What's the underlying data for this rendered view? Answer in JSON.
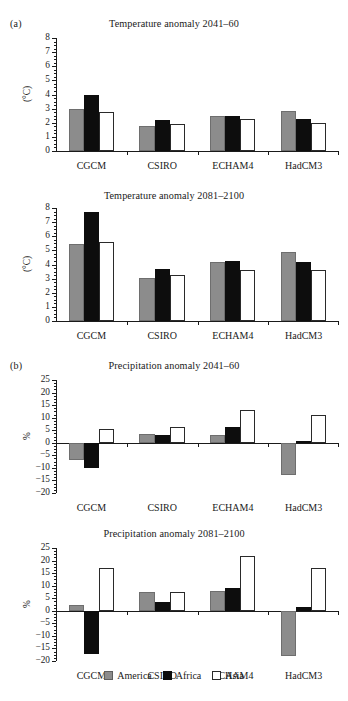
{
  "figure": {
    "panels": [
      {
        "tag": "(a)"
      },
      {
        "tag": "(b)"
      }
    ]
  },
  "legend": {
    "position": "bottom-center",
    "entries": [
      {
        "label": "America",
        "color": "#8c8c8c",
        "key": "america"
      },
      {
        "label": "Africa",
        "color": "#0d0d0d",
        "key": "africa"
      },
      {
        "label": "Asia",
        "color": "#ffffff",
        "key": "asia"
      }
    ]
  },
  "chart_data": [
    {
      "id": "temp-2041-60",
      "type": "bar",
      "title": "Temperature anomaly 2041–60",
      "panel": "(a)",
      "xlabel": "",
      "ylabel": "(°C)",
      "ylim": [
        0,
        8
      ],
      "yticks": [
        0,
        1,
        2,
        3,
        4,
        5,
        6,
        7,
        8
      ],
      "ytick_labels": [
        "0",
        "1",
        "2",
        "3",
        "4",
        "5",
        "6",
        "7",
        "8"
      ],
      "minor_tick_step": 0.25,
      "grid": false,
      "categories": [
        "CGCM",
        "CSIRO",
        "ECHAM4",
        "HadCM3"
      ],
      "series": [
        {
          "name": "America",
          "values": [
            2.95,
            1.8,
            2.5,
            2.8
          ]
        },
        {
          "name": "Africa",
          "values": [
            4.0,
            2.2,
            2.45,
            2.3
          ]
        },
        {
          "name": "Asia",
          "values": [
            2.75,
            1.9,
            2.25,
            2.0
          ]
        }
      ]
    },
    {
      "id": "temp-2081-2100",
      "type": "bar",
      "title": "Temperature anomaly 2081–2100",
      "panel": "(a)",
      "xlabel": "",
      "ylabel": "(°C)",
      "ylim": [
        0,
        8
      ],
      "yticks": [
        0,
        1,
        2,
        3,
        4,
        5,
        6,
        7,
        8
      ],
      "ytick_labels": [
        "0",
        "1",
        "2",
        "3",
        "4",
        "5",
        "6",
        "7",
        "8"
      ],
      "minor_tick_step": 0.25,
      "grid": false,
      "categories": [
        "CGCM",
        "CSIRO",
        "ECHAM4",
        "HadCM3"
      ],
      "series": [
        {
          "name": "America",
          "values": [
            5.45,
            3.05,
            4.15,
            4.85
          ]
        },
        {
          "name": "Africa",
          "values": [
            7.75,
            3.7,
            4.25,
            4.2
          ]
        },
        {
          "name": "Asia",
          "values": [
            5.6,
            3.25,
            3.6,
            3.6
          ]
        }
      ]
    },
    {
      "id": "precip-2041-60",
      "type": "bar",
      "title": "Precipitation anomaly 2041–60",
      "panel": "(b)",
      "xlabel": "",
      "ylabel": "%",
      "ylim": [
        -20,
        25
      ],
      "yticks": [
        -20,
        -15,
        -10,
        -5,
        0,
        5,
        10,
        15,
        20,
        25
      ],
      "ytick_labels": [
        "−20",
        "−15",
        "−10",
        "−5",
        "0",
        "5",
        "10",
        "15",
        "20",
        "25"
      ],
      "minor_tick_step": 1.25,
      "grid": false,
      "categories": [
        "CGCM",
        "CSIRO",
        "ECHAM4",
        "HadCM3"
      ],
      "series": [
        {
          "name": "America",
          "values": [
            -6.8,
            3.4,
            3.0,
            -12.7
          ]
        },
        {
          "name": "Africa",
          "values": [
            -10.2,
            3.1,
            6.2,
            0.9
          ]
        },
        {
          "name": "Asia",
          "values": [
            5.3,
            6.2,
            13.2,
            11.1
          ]
        }
      ]
    },
    {
      "id": "precip-2081-2100",
      "type": "bar",
      "title": "Precipitation anomaly 2081–2100",
      "panel": "(b)",
      "xlabel": "",
      "ylabel": "%",
      "ylim": [
        -20,
        25
      ],
      "yticks": [
        -20,
        -15,
        -10,
        -5,
        0,
        5,
        10,
        15,
        20,
        25
      ],
      "ytick_labels": [
        "−20",
        "−15",
        "−10",
        "−5",
        "0",
        "5",
        "10",
        "15",
        "20",
        "25"
      ],
      "minor_tick_step": 1.25,
      "grid": false,
      "categories": [
        "CGCM",
        "CSIRO",
        "ECHAM4",
        "HadCM3"
      ],
      "series": [
        {
          "name": "America",
          "values": [
            2.4,
            7.6,
            7.9,
            -18.2
          ]
        },
        {
          "name": "Africa",
          "values": [
            -17.4,
            3.4,
            9.0,
            1.6
          ]
        },
        {
          "name": "Asia",
          "values": [
            17.0,
            7.6,
            22.0,
            17.0
          ]
        }
      ]
    }
  ],
  "layout": {
    "charts": [
      {
        "id": "temp-2041-60",
        "panelTop": 18,
        "plotLeft": 56,
        "plotTop": 38,
        "plotWidth": 283,
        "plotHeight": 113,
        "titleTop": 0,
        "tag": "(a)"
      },
      {
        "id": "temp-2081-2100",
        "panelTop": 190,
        "plotLeft": 56,
        "plotTop": 208,
        "plotWidth": 283,
        "plotHeight": 113,
        "titleTop": 0,
        "tag": ""
      },
      {
        "id": "precip-2041-60",
        "panelTop": 360,
        "plotLeft": 56,
        "plotTop": 380,
        "plotWidth": 283,
        "plotHeight": 113,
        "titleTop": 0,
        "tag": "(b)"
      },
      {
        "id": "precip-2081-2100",
        "panelTop": 528,
        "plotLeft": 56,
        "plotTop": 548,
        "plotWidth": 283,
        "plotHeight": 113,
        "titleTop": 0,
        "tag": ""
      }
    ],
    "legendTop": 670,
    "catLabelOffset": 9,
    "barGroupInnerPad": 0.3,
    "barGroupOuterPad": 0.18
  }
}
